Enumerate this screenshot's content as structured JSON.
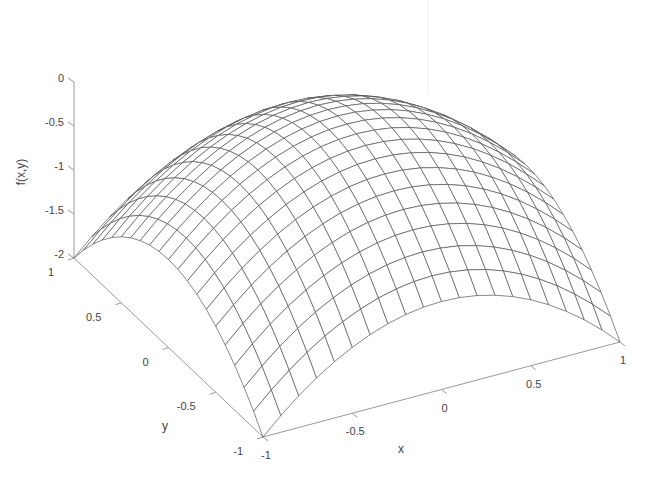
{
  "chart_data": {
    "type": "surface",
    "function": "f(x,y) = -(x^2 + y^2)",
    "title": "",
    "xlabel": "x",
    "ylabel": "y",
    "zlabel": "f(x,y)",
    "xlim": [
      -1,
      1
    ],
    "ylim": [
      -1,
      1
    ],
    "zlim": [
      -2,
      0
    ],
    "x_ticks": [
      -1,
      -0.5,
      0,
      0.5,
      1
    ],
    "x_tick_labels": [
      "-1",
      "-0.5",
      "0",
      "0.5",
      "1"
    ],
    "y_ticks": [
      -1,
      -0.5,
      0,
      0.5,
      1
    ],
    "y_tick_labels": [
      "-1",
      "-0.5",
      "0",
      "0.5",
      "1"
    ],
    "z_ticks": [
      -2,
      -1.5,
      -1,
      -0.5,
      0
    ],
    "z_tick_labels": [
      "-2",
      "-1.5",
      "-1",
      "-0.5",
      "0"
    ],
    "grid": false,
    "mesh_resolution": 21,
    "mesh_color": "#555555",
    "face_color": "#ffffff",
    "axis_color": "#999999",
    "sample_points": [
      {
        "x": -1,
        "y": -1,
        "z": -2
      },
      {
        "x": -1,
        "y": 1,
        "z": -2
      },
      {
        "x": 1,
        "y": -1,
        "z": -2
      },
      {
        "x": 1,
        "y": 1,
        "z": -2
      },
      {
        "x": 0,
        "y": 0,
        "z": 0
      },
      {
        "x": 0.5,
        "y": 0.5,
        "z": -0.5
      },
      {
        "x": -0.5,
        "y": 0.5,
        "z": -0.5
      },
      {
        "x": 1,
        "y": 0,
        "z": -1
      },
      {
        "x": 0,
        "y": -1,
        "z": -1
      }
    ]
  },
  "projection": {
    "origin": [
      263,
      437
    ],
    "ex": [
      178.5,
      -47.5
    ],
    "ey": [
      -94.5,
      -89.5
    ],
    "ez": [
      0,
      -88
    ]
  }
}
